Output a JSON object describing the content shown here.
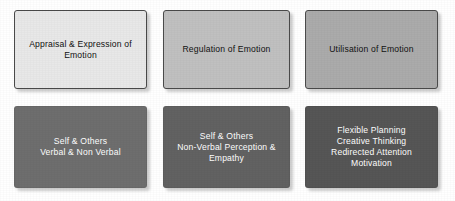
{
  "diagram": {
    "type": "grid",
    "background_color": "#ffffff",
    "rows": 2,
    "columns": 3,
    "top_row": {
      "text_color": "#111111",
      "border_color": "#4a4a4a",
      "boxes": [
        {
          "id": "appraisal-expression",
          "label": "Appraisal & Expression of\nEmotion",
          "fill_color": "#e8e8e8"
        },
        {
          "id": "regulation",
          "label": "Regulation of Emotion",
          "fill_color": "#c0c0c0"
        },
        {
          "id": "utilisation",
          "label": "Utilisation of Emotion",
          "fill_color": "#ababab"
        }
      ]
    },
    "bottom_row": {
      "text_color": "#ffffff",
      "boxes": [
        {
          "id": "self-others-verbal",
          "label": "Self & Others\nVerbal & Non Verbal",
          "fill_color": "#6e6e6e"
        },
        {
          "id": "self-others-nonverbal",
          "label": "Self & Others\nNon-Verbal Perception &\nEmpathy",
          "fill_color": "#626262"
        },
        {
          "id": "planning-thinking",
          "label": "Flexible Planning\nCreative Thinking\nRedirected Attention\nMotivation",
          "fill_color": "#565656"
        }
      ]
    }
  }
}
